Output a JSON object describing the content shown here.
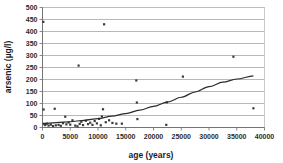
{
  "chart_data": {
    "type": "scatter",
    "title": "",
    "xlabel": "age (years)",
    "ylabel": "arsenic (µg/l)",
    "xlim": [
      0,
      40000
    ],
    "ylim": [
      0,
      500
    ],
    "xticks": [
      0,
      5000,
      10000,
      15000,
      20000,
      25000,
      30000,
      35000,
      40000
    ],
    "xtick_labels": [
      "0",
      "5000",
      "10000",
      "15000",
      "20000",
      "25000",
      "30000",
      "35000",
      "40000"
    ],
    "yticks": [
      0,
      50,
      100,
      150,
      200,
      250,
      300,
      350,
      400,
      450,
      500
    ],
    "ytick_labels": [
      "0",
      "50",
      "100",
      "150",
      "200",
      "250",
      "300",
      "350",
      "400",
      "450",
      "500"
    ],
    "grid": true,
    "grid_axis": "y",
    "legend": false,
    "marker": "square",
    "marker_color": "#3a3a3a",
    "series": [
      {
        "name": "arsenic vs age",
        "points": [
          [
            150,
            440
          ],
          [
            200,
            75
          ],
          [
            300,
            14
          ],
          [
            500,
            10
          ],
          [
            800,
            16
          ],
          [
            1100,
            8
          ],
          [
            1500,
            12
          ],
          [
            1900,
            6
          ],
          [
            2200,
            78
          ],
          [
            2400,
            9
          ],
          [
            2900,
            11
          ],
          [
            3300,
            7
          ],
          [
            3700,
            18
          ],
          [
            4100,
            45
          ],
          [
            4300,
            13
          ],
          [
            4700,
            21
          ],
          [
            5000,
            12
          ],
          [
            5400,
            30
          ],
          [
            5900,
            8
          ],
          [
            6300,
            5
          ],
          [
            6500,
            258
          ],
          [
            6700,
            15
          ],
          [
            7000,
            24
          ],
          [
            7300,
            10
          ],
          [
            7800,
            28
          ],
          [
            8200,
            14
          ],
          [
            8600,
            20
          ],
          [
            9000,
            11
          ],
          [
            9400,
            27
          ],
          [
            9800,
            17
          ],
          [
            10200,
            36
          ],
          [
            10500,
            9
          ],
          [
            10700,
            46
          ],
          [
            10900,
            76
          ],
          [
            11100,
            430
          ],
          [
            11400,
            22
          ],
          [
            12000,
            30
          ],
          [
            12600,
            19
          ],
          [
            13300,
            16
          ],
          [
            14300,
            16
          ],
          [
            16900,
            196
          ],
          [
            17000,
            104
          ],
          [
            17100,
            35
          ],
          [
            22300,
            11
          ],
          [
            22400,
            105
          ],
          [
            25300,
            212
          ],
          [
            34400,
            295
          ],
          [
            38000,
            80
          ]
        ]
      }
    ],
    "trend": {
      "name": "fitted trend",
      "points": [
        [
          0,
          17
        ],
        [
          2500,
          20
        ],
        [
          5000,
          24
        ],
        [
          7500,
          30
        ],
        [
          10000,
          37
        ],
        [
          12500,
          47
        ],
        [
          15000,
          58
        ],
        [
          17500,
          72
        ],
        [
          20000,
          88
        ],
        [
          22500,
          106
        ],
        [
          25000,
          126
        ],
        [
          27500,
          148
        ],
        [
          30000,
          170
        ],
        [
          32500,
          189
        ],
        [
          35000,
          202
        ],
        [
          38000,
          215
        ]
      ]
    }
  }
}
